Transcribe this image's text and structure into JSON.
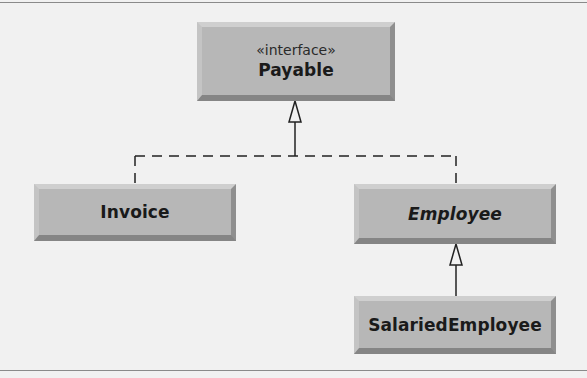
{
  "diagram": {
    "type": "UML class diagram",
    "classes": [
      {
        "id": "payable",
        "stereotype": "«interface»",
        "name": "Payable",
        "abstract": false
      },
      {
        "id": "invoice",
        "name": "Invoice",
        "abstract": false
      },
      {
        "id": "employee",
        "name": "Employee",
        "abstract": true
      },
      {
        "id": "salaried",
        "name": "SalariedEmployee",
        "abstract": false
      }
    ],
    "relationships": [
      {
        "from": "Invoice",
        "to": "Payable",
        "kind": "realization",
        "style": "dashed",
        "arrowhead": "hollow-triangle"
      },
      {
        "from": "Employee",
        "to": "Payable",
        "kind": "realization",
        "style": "dashed",
        "arrowhead": "hollow-triangle"
      },
      {
        "from": "SalariedEmployee",
        "to": "Employee",
        "kind": "generalization",
        "style": "solid",
        "arrowhead": "hollow-triangle"
      }
    ],
    "colors": {
      "box_fill": "#b7b7b7",
      "line": "#222222",
      "background": "#f1f1f1"
    }
  }
}
